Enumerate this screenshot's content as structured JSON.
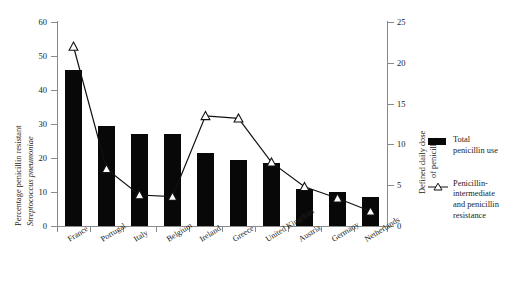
{
  "chart_data": {
    "type": "bar",
    "title": "",
    "categories": [
      "France",
      "Portugal",
      "Italy",
      "Belgium",
      "Ireland",
      "Greece",
      "United Kingdom",
      "Austria",
      "Germany",
      "Netherlands"
    ],
    "series": [
      {
        "name": "Total penicillin use",
        "axis": "right",
        "render": "bar",
        "values": [
          46,
          29.5,
          27,
          27,
          21.5,
          19.5,
          18.5,
          11,
          10,
          8.5
        ]
      },
      {
        "name": "Penicillin-intermediate and penicillin resistance",
        "axis": "right-ddd",
        "render": "line-marker",
        "values": [
          22,
          7,
          3.8,
          3.6,
          13.5,
          13.2,
          7.8,
          4.8,
          3.4,
          1.8
        ]
      }
    ],
    "xlabel": "",
    "ylabel": "Percentage penicillin resistant Streptococcus pneumoniae",
    "ylabel_part1": "Percentage penicillin resistant",
    "ylabel_part2": "Streptococcus pneumoniae",
    "ylabel_right": "Defined daily dose of penicillin",
    "ylabel_right_line1": "Defined daily dose",
    "ylabel_right_line2": "of penicillin",
    "ylim": [
      0,
      60
    ],
    "yticks": [
      "0",
      "10",
      "20",
      "30",
      "40",
      "50",
      "60"
    ],
    "ylim_right": [
      0,
      25
    ],
    "yticks_right": [
      "0",
      "5",
      "10",
      "15",
      "20",
      "25"
    ],
    "grid": false,
    "legend_position": "right",
    "bar_color": "#080808",
    "line_color": "#111111",
    "marker": "open-triangle"
  },
  "legend": {
    "items": [
      {
        "label_line1": "Total",
        "label_line2": "penicillin use",
        "swatch": "bar-swatch"
      },
      {
        "label_line1": "Penicillin-",
        "label_line2": "intermediate",
        "label_line3": "and penicillin",
        "label_line4": "resistance",
        "swatch": "triangle-line-swatch"
      }
    ]
  }
}
